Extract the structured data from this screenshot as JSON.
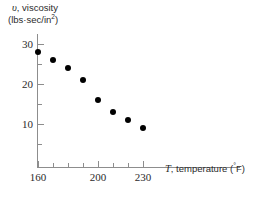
{
  "chart_data": {
    "type": "scatter",
    "title": "",
    "xlabel": "T, temperature (°F)",
    "ylabel": "v, viscosity (lbs·sec/in²)",
    "xlabel_symbol": "T",
    "xlabel_rest": ", temperature (",
    "xlabel_degree": "°",
    "xlabel_tail": "F)",
    "ylabel_symbol": "υ",
    "ylabel_line1_rest": ", viscosity",
    "ylabel_line2_pre": "(lbs·sec/in",
    "ylabel_line2_sup": "2",
    "ylabel_line2_post": ")",
    "x": [
      160,
      170,
      180,
      190,
      200,
      210,
      220,
      230
    ],
    "values": [
      28,
      26,
      24,
      21,
      16,
      13,
      11,
      9
    ],
    "points": [
      {
        "x": 160,
        "y": 28
      },
      {
        "x": 170,
        "y": 26
      },
      {
        "x": 180,
        "y": 24
      },
      {
        "x": 190,
        "y": 21
      },
      {
        "x": 200,
        "y": 16
      },
      {
        "x": 210,
        "y": 13
      },
      {
        "x": 220,
        "y": 11
      },
      {
        "x": 230,
        "y": 9
      }
    ],
    "xlim": [
      155,
      290
    ],
    "ylim": [
      0,
      33
    ],
    "grid": false,
    "legend": null,
    "marker_color": "#000000",
    "axis_color": "#8d8d8d",
    "text_color": "#2b2b2b",
    "background_color": "#ffffff",
    "x_ticks_major": [
      {
        "value": 160,
        "label": "160"
      },
      {
        "value": 200,
        "label": "200"
      },
      {
        "value": 230,
        "label": "230"
      }
    ],
    "x_ticks_minor": [
      170,
      180,
      190,
      210,
      220
    ],
    "y_ticks_major": [
      {
        "value": 10,
        "label": "10"
      },
      {
        "value": 20,
        "label": "20"
      },
      {
        "value": 30,
        "label": "30"
      }
    ],
    "y_ticks_minor": [
      5,
      15,
      25
    ]
  }
}
